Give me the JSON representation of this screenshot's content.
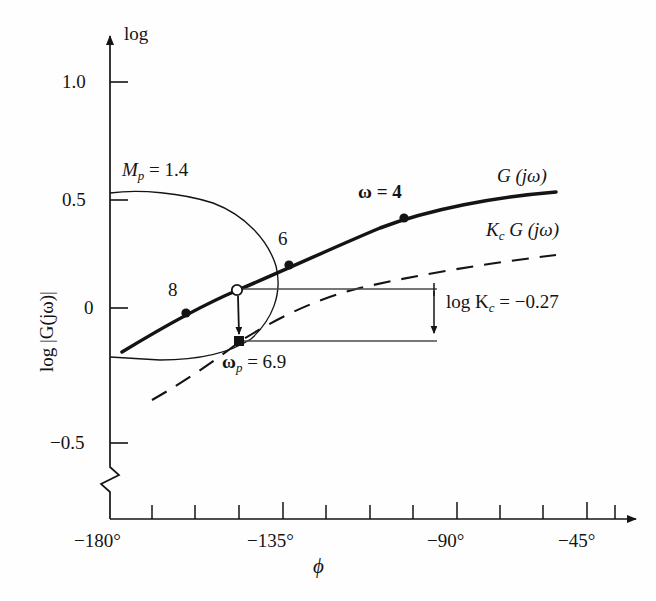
{
  "figure": {
    "kind": "nichols-chart",
    "background": "#fefefe",
    "ink": "#141414",
    "thin_ink": "#4a4a4a"
  },
  "axes": {
    "y": {
      "label": "log |G(jω)|",
      "top_label": "log",
      "ticks": [
        {
          "value": 1.0,
          "text": "1.0",
          "y": 82
        },
        {
          "value": 0.5,
          "text": "0.5",
          "y": 200
        },
        {
          "value": 0.0,
          "text": "0",
          "y": 308
        },
        {
          "value": -0.5,
          "text": "−0.5",
          "y": 443
        }
      ],
      "has_break": true,
      "axis_x": 110,
      "arrow_top_y": 28,
      "baseline_y": 519
    },
    "x": {
      "label": "ϕ",
      "ticks": [
        {
          "value": -180,
          "text": "−180°",
          "x": 110,
          "major": true
        },
        {
          "value": -168.75,
          "text": "",
          "x": 152,
          "major": false
        },
        {
          "value": -157.5,
          "text": "",
          "x": 195,
          "major": false
        },
        {
          "value": -146.25,
          "text": "",
          "x": 239,
          "major": false
        },
        {
          "value": -135,
          "text": "−135°",
          "x": 283,
          "major": true
        },
        {
          "value": -123.75,
          "text": "",
          "x": 326,
          "major": false
        },
        {
          "value": -112.5,
          "text": "",
          "x": 370,
          "major": false
        },
        {
          "value": -101.25,
          "text": "",
          "x": 413,
          "major": false
        },
        {
          "value": -90,
          "text": "−90°",
          "x": 457,
          "major": true
        },
        {
          "value": -78.75,
          "text": "",
          "x": 500,
          "major": false
        },
        {
          "value": -67.5,
          "text": "",
          "x": 523,
          "major": false
        },
        {
          "value": -56.25,
          "text": "",
          "x": 565,
          "major": false
        },
        {
          "value": -45,
          "text": "−45°",
          "x": 587,
          "major": true
        },
        {
          "value": -33.75,
          "text": "",
          "x": 610,
          "major": false
        }
      ],
      "arrow_right_x": 645
    }
  },
  "curves": {
    "g_jomega": {
      "label": "G (jω)",
      "style": "solid-thick",
      "label_x": 497,
      "label_y": 174,
      "points": [
        [
          122,
          352
        ],
        [
          150,
          334
        ],
        [
          180,
          316
        ],
        [
          210,
          300
        ],
        [
          237,
          290
        ],
        [
          250,
          284
        ],
        [
          275,
          272
        ],
        [
          300,
          261
        ],
        [
          330,
          248
        ],
        [
          360,
          236
        ],
        [
          404,
          218
        ],
        [
          450,
          207
        ],
        [
          500,
          199
        ],
        [
          555,
          193
        ]
      ]
    },
    "kc_g_jomega": {
      "label": "K",
      "label_sub": "c",
      "label_rest": " G (jω)",
      "style": "dashed",
      "label_x": 487,
      "label_y": 228,
      "points": [
        [
          152,
          400
        ],
        [
          180,
          382
        ],
        [
          210,
          364
        ],
        [
          239,
          341
        ],
        [
          270,
          327
        ],
        [
          300,
          315
        ],
        [
          335,
          302
        ],
        [
          370,
          291
        ],
        [
          410,
          281
        ],
        [
          455,
          272
        ],
        [
          505,
          263
        ],
        [
          555,
          256
        ]
      ]
    },
    "mp_contour": {
      "label": "M",
      "label_sub": "p",
      "label_rest": " = 1.4",
      "label_x": 122,
      "label_y": 167,
      "style": "solid-thin",
      "description": "closed M-circle contour touching the vertical axis",
      "points": [
        [
          110,
          193
        ],
        [
          140,
          190
        ],
        [
          175,
          192
        ],
        [
          210,
          201
        ],
        [
          240,
          216
        ],
        [
          263,
          238
        ],
        [
          275,
          264
        ],
        [
          277,
          290
        ],
        [
          270,
          316
        ],
        [
          252,
          338
        ],
        [
          225,
          352
        ],
        [
          192,
          359
        ],
        [
          155,
          360
        ],
        [
          122,
          358
        ],
        [
          110,
          357
        ]
      ]
    }
  },
  "markers": [
    {
      "name": "omega-8",
      "label": "8",
      "shape": "filled-circle",
      "x": 186,
      "y": 313,
      "label_x": 170,
      "label_y": 288
    },
    {
      "name": "omega-6",
      "label": "6",
      "shape": "filled-circle",
      "x": 289,
      "y": 265,
      "label_x": 280,
      "label_y": 237
    },
    {
      "name": "omega-4",
      "label": "ω = 4",
      "shape": "filled-circle",
      "x": 404,
      "y": 218,
      "label_x": 361,
      "label_y": 190
    },
    {
      "name": "omega-p-open",
      "label": "",
      "shape": "open-circle",
      "x": 237,
      "y": 290,
      "label_x": 0,
      "label_y": 0
    },
    {
      "name": "omega-p-square",
      "label": "ω",
      "label_sub": "p",
      "label_rest": " = 6.9",
      "shape": "filled-square",
      "x": 239,
      "y": 341,
      "label_x": 225,
      "label_y": 360
    }
  ],
  "annotations": {
    "gain_drop": {
      "label": "log K",
      "label_sub": "c",
      "label_rest": " = −0.27",
      "label_x": 446,
      "label_y": 300,
      "upper_line_y": 289,
      "lower_line_y": 341,
      "line_left_x": 237,
      "line_right_x": 437,
      "arrow_x": 434
    },
    "drop_arrow": {
      "from_x": 237,
      "from_y": 294,
      "to_x": 239,
      "to_y": 337
    }
  }
}
